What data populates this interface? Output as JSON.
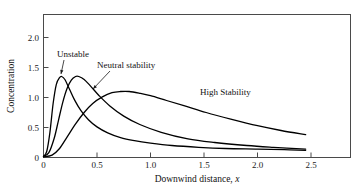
{
  "chart_data": {
    "type": "line",
    "title": "",
    "xlabel": "Downwind distance, x",
    "ylabel": "Concentration",
    "xlim": [
      0,
      2.8
    ],
    "ylim": [
      0,
      2.35
    ],
    "grid": false,
    "legend": "inline-annotations",
    "xticks": [
      0,
      0.5,
      1.0,
      1.5,
      2.0,
      2.5
    ],
    "xticklabels": [
      "0",
      "0.5",
      "1.0",
      "1.5",
      "2.0",
      "2.5"
    ],
    "yticks": [
      0,
      0.5,
      1.0,
      1.5,
      2.0
    ],
    "yticklabels": [
      "0",
      "0.5",
      "1.0",
      "1.5",
      "2.0"
    ],
    "series": [
      {
        "name": "Unstable",
        "label": "Unstable",
        "peak_x": 0.17,
        "peak_y": 1.35,
        "x": [
          0.0,
          0.03,
          0.06,
          0.09,
          0.12,
          0.15,
          0.17,
          0.2,
          0.24,
          0.29,
          0.35,
          0.42,
          0.5,
          0.6,
          0.72,
          0.85,
          1.0,
          1.2,
          1.45,
          1.7,
          2.0,
          2.25,
          2.45
        ],
        "y": [
          0.02,
          0.1,
          0.42,
          0.9,
          1.22,
          1.33,
          1.35,
          1.3,
          1.15,
          0.96,
          0.78,
          0.63,
          0.51,
          0.41,
          0.33,
          0.28,
          0.24,
          0.2,
          0.17,
          0.15,
          0.14,
          0.13,
          0.12
        ]
      },
      {
        "name": "Neutral stability",
        "label": "Neutral stability",
        "peak_x": 0.33,
        "peak_y": 1.35,
        "x": [
          0.0,
          0.05,
          0.1,
          0.14,
          0.18,
          0.22,
          0.26,
          0.3,
          0.33,
          0.38,
          0.44,
          0.52,
          0.62,
          0.75,
          0.9,
          1.1,
          1.35,
          1.6,
          1.9,
          2.15,
          2.45
        ],
        "y": [
          0.02,
          0.08,
          0.32,
          0.62,
          0.92,
          1.15,
          1.29,
          1.35,
          1.35,
          1.3,
          1.19,
          1.03,
          0.86,
          0.69,
          0.55,
          0.42,
          0.31,
          0.25,
          0.2,
          0.17,
          0.14
        ]
      },
      {
        "name": "High Stability",
        "label": "High Stability",
        "peak_x": 0.8,
        "peak_y": 1.1,
        "x": [
          0.0,
          0.08,
          0.15,
          0.22,
          0.3,
          0.38,
          0.46,
          0.55,
          0.64,
          0.72,
          0.8,
          0.9,
          1.0,
          1.15,
          1.32,
          1.52,
          1.75,
          2.0,
          2.22,
          2.45
        ],
        "y": [
          0.01,
          0.04,
          0.15,
          0.34,
          0.56,
          0.75,
          0.9,
          1.01,
          1.08,
          1.1,
          1.1,
          1.07,
          1.03,
          0.95,
          0.86,
          0.75,
          0.64,
          0.53,
          0.45,
          0.38
        ]
      }
    ],
    "annotations": [
      {
        "text": "Unstable",
        "text_x_px": 57,
        "text_y_px": 57,
        "leader_from": [
          64,
          60
        ],
        "leader_to": [
          61,
          74
        ]
      },
      {
        "text": "Neutral stability",
        "text_x_px": 97,
        "text_y_px": 68,
        "leader_from": [
          110,
          71
        ],
        "leader_to": [
          93,
          89
        ]
      },
      {
        "text": "High Stability",
        "text_x_px": 200,
        "text_y_px": 95,
        "leader_from": null,
        "leader_to": null
      }
    ]
  },
  "colors": {
    "curve": "#000000",
    "frame": "#4a4a4a",
    "text": "#111111",
    "background": "#ffffff"
  }
}
